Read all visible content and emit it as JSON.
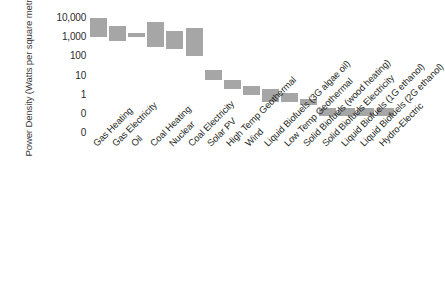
{
  "chart_data": {
    "type": "bar",
    "bar_style": "floating-range",
    "title": "",
    "subtitle": "",
    "xlabel": "",
    "ylabel": "Power Density (Watts per square metre)",
    "yscale": "log",
    "ylim": [
      0.01,
      10000
    ],
    "ytick_labels": [
      "10,000",
      "1,000",
      "100",
      "10",
      "1",
      "0",
      "0"
    ],
    "ytick_values": [
      10000,
      1000,
      100,
      10,
      1,
      0.1,
      0.01
    ],
    "grid": false,
    "legend": null,
    "categories": [
      "Gas Heating",
      "Gas Electricity",
      "Oil",
      "Coal Heating",
      "Nuclear",
      "Coal Electricity",
      "Solar PV",
      "High Temp Geothermal",
      "Wind",
      "Liquid Biofuels (3G algae oil)",
      "Low Temp Geothermal",
      "Solid Biofuels (wood heating)",
      "Solid Biofuels Electricity",
      "Liquid Biofuels (1G ethanol)",
      "Liquid Biofuels (2G ethanol)",
      "Hydro-Electric"
    ],
    "ranges": [
      {
        "category": "Gas Heating",
        "low": 1000,
        "high": 10000
      },
      {
        "category": "Gas Electricity",
        "low": 600,
        "high": 4000
      },
      {
        "category": "Oil",
        "low": 1000,
        "high": 1600
      },
      {
        "category": "Coal Heating",
        "low": 300,
        "high": 6000
      },
      {
        "category": "Nuclear",
        "low": 240,
        "high": 2000
      },
      {
        "category": "Coal Electricity",
        "low": 100,
        "high": 3000
      },
      {
        "category": "Solar PV",
        "low": 6,
        "high": 20
      },
      {
        "category": "High Temp Geothermal",
        "low": 2,
        "high": 6
      },
      {
        "category": "Wind",
        "low": 1,
        "high": 3
      },
      {
        "category": "Liquid Biofuels (3G algae oil)",
        "low": 0.4,
        "high": 2
      },
      {
        "category": "Low Temp Geothermal",
        "low": 0.4,
        "high": 1.2
      },
      {
        "category": "Solid Biofuels (wood heating)",
        "low": 0.3,
        "high": 0.6
      },
      {
        "category": "Solid Biofuels Electricity",
        "low": 0.08,
        "high": 0.2
      },
      {
        "category": "Liquid Biofuels (1G ethanol)",
        "low": 0.08,
        "high": 0.2
      },
      {
        "category": "Liquid Biofuels (2G ethanol)",
        "low": 0.08,
        "high": 0.2
      },
      {
        "category": "Hydro-Electric",
        "low": 0.08,
        "high": 0.2
      }
    ],
    "colors": {
      "bar": "#a6a6a6",
      "text": "#231f20",
      "background": "#ffffff"
    }
  }
}
